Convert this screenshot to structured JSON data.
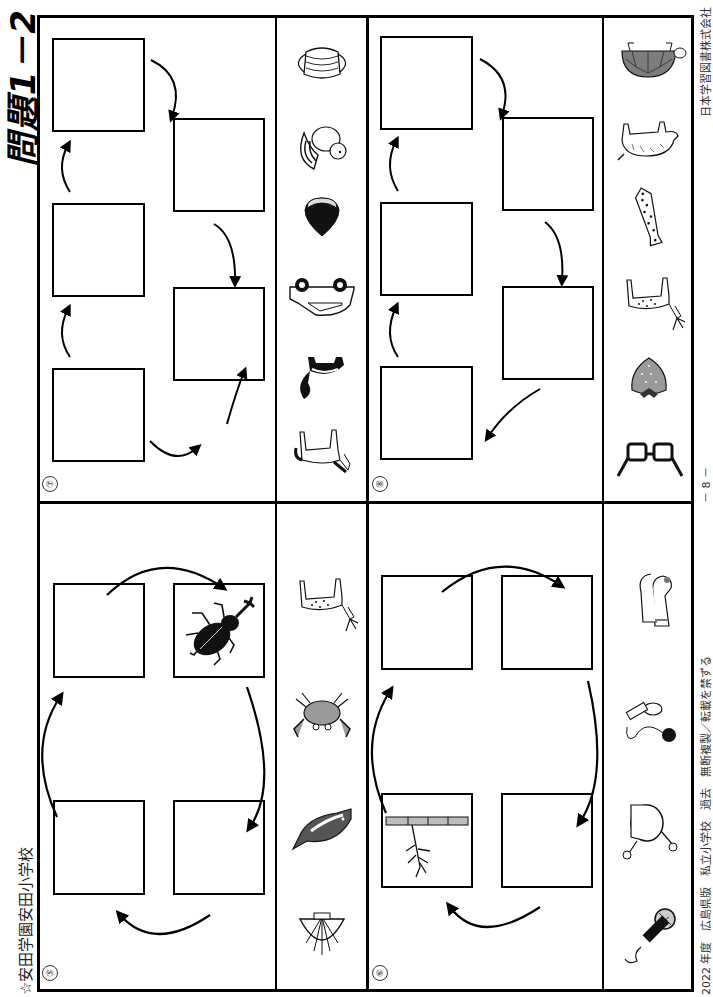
{
  "header": {
    "school": "☆安田学園安田小学校",
    "title": "問題1－2"
  },
  "footer": {
    "copyright": "2022 年度　広島県版　私立小学校　過去　無断複製／転載を禁ずる",
    "page": "－ 8 －",
    "publisher": "日本学習図書株式会社"
  },
  "problems": [
    {
      "number": "⑤",
      "layout": "cycle-4",
      "filled_boxes": [
        {
          "position": "top-right",
          "image": "beetle"
        }
      ],
      "choices": [
        "shell",
        "dolphin",
        "crab",
        "deer"
      ]
    },
    {
      "number": "⑥",
      "layout": "cycle-4",
      "filled_boxes": [
        {
          "position": "top-left",
          "image": "bamboo-shoot-branch"
        }
      ],
      "choices": [
        "microphone",
        "drum",
        "kendama",
        "socks"
      ]
    },
    {
      "number": "⑦",
      "layout": "zigzag-5",
      "filled_boxes": [],
      "choices": [
        "horse",
        "skunk",
        "car",
        "chestnut",
        "squirrel",
        "mask"
      ]
    },
    {
      "number": "⑧",
      "layout": "zigzag-5",
      "filled_boxes": [],
      "choices": [
        "glasses",
        "strawberry",
        "deer",
        "necktie",
        "boar",
        "turtle"
      ]
    }
  ],
  "colors": {
    "ink": "#000000",
    "gray_fill": "#8a8a8a",
    "light_gray": "#bdbdbd"
  }
}
